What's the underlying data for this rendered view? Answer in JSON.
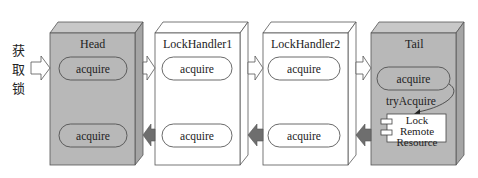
{
  "diagram": {
    "entry_label": [
      "获",
      "取",
      "锁"
    ],
    "nodes": [
      {
        "id": "head",
        "title": "Head",
        "fill": "#b8b8b8",
        "top_method": "acquire",
        "bottom_method": "acquire"
      },
      {
        "id": "lockhandler1",
        "title": "LockHandler1",
        "fill": "#ffffff",
        "top_method": "acquire",
        "bottom_method": "acquire"
      },
      {
        "id": "lockhandler2",
        "title": "LockHandler2",
        "fill": "#ffffff",
        "top_method": "acquire",
        "bottom_method": "acquire"
      },
      {
        "id": "tail",
        "title": "Tail",
        "fill": "#b8b8b8",
        "top_method": "acquire",
        "call_label": "tryAcquire",
        "resource": {
          "line1": "Lock",
          "line2": "Remote",
          "line3": "Resource"
        }
      }
    ],
    "forward_arrow_style": "open-white",
    "backward_arrow_style": "filled-dark",
    "colors": {
      "gray_box": "#b8b8b8",
      "gray_side": "#a5a5a5",
      "dark_arrow": "#6e6e6e",
      "line": "#555555"
    }
  }
}
